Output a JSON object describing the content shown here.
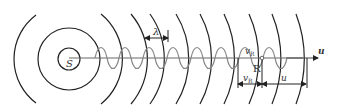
{
  "diagram": {
    "title": "",
    "labels": {
      "source": "S",
      "wavelength": "λ",
      "receiver": "R",
      "receiver_velocity_top": "v",
      "receiver_velocity_sub": "R",
      "receiver_velocity_bottom": "v",
      "receiver_velocity_bottom_sub": "R",
      "wave_speed": "u",
      "axis_direction": "u"
    },
    "colors": {
      "wavefront": "#222222",
      "axis": "#555555",
      "wave": "#888888",
      "text": "#333333"
    },
    "elements": {
      "source_circles": 2,
      "wavefront_arcs": 10,
      "sine_wave": "sinusoidal wave along propagation axis",
      "dimension_lines": [
        "λ between adjacent wavefronts",
        "v_R segment",
        "u segment"
      ]
    }
  }
}
